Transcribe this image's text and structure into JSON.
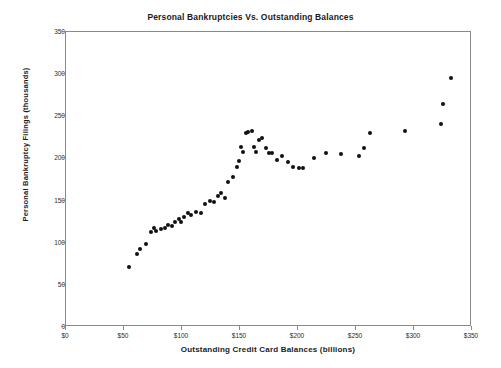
{
  "chart_data": {
    "type": "scatter",
    "title": "Personal Bankruptcies Vs. Outstanding Balances",
    "xlabel": "Outstanding Credit Card Balances (billions)",
    "ylabel": "Personal Bankruptcy Filings (thousands)",
    "xlim": [
      0,
      350
    ],
    "ylim": [
      0,
      350
    ],
    "xticks": [
      0,
      50,
      100,
      150,
      200,
      250,
      300,
      350
    ],
    "xtick_labels": [
      "$0",
      "$50",
      "$100",
      "$150",
      "$200",
      "$250",
      "$300",
      "$350"
    ],
    "yticks": [
      0,
      50,
      100,
      150,
      200,
      250,
      300,
      350
    ],
    "ytick_labels": [
      "0",
      "50",
      "100",
      "150",
      "200",
      "250",
      "300",
      "350"
    ],
    "grid": false,
    "legend": null,
    "marker_color": "#111111",
    "frame_color": "#8a8a8a",
    "series": [
      {
        "name": "Bankruptcy filings vs credit card balances",
        "points": [
          [
            54,
            71
          ],
          [
            61,
            87
          ],
          [
            64,
            93
          ],
          [
            69,
            99
          ],
          [
            73,
            113
          ],
          [
            76,
            118
          ],
          [
            78,
            114
          ],
          [
            82,
            116
          ],
          [
            85,
            118
          ],
          [
            88,
            121
          ],
          [
            91,
            120
          ],
          [
            94,
            124
          ],
          [
            97,
            128
          ],
          [
            99,
            125
          ],
          [
            102,
            131
          ],
          [
            105,
            135
          ],
          [
            108,
            133
          ],
          [
            112,
            136
          ],
          [
            116,
            135
          ],
          [
            120,
            146
          ],
          [
            124,
            150
          ],
          [
            128,
            148
          ],
          [
            131,
            155
          ],
          [
            134,
            159
          ],
          [
            137,
            153
          ],
          [
            140,
            172
          ],
          [
            144,
            178
          ],
          [
            147,
            190
          ],
          [
            149,
            197
          ],
          [
            151,
            213
          ],
          [
            153,
            208
          ],
          [
            155,
            230
          ],
          [
            157,
            231
          ],
          [
            160,
            233
          ],
          [
            162,
            214
          ],
          [
            164,
            208
          ],
          [
            166,
            222
          ],
          [
            169,
            224
          ],
          [
            172,
            212
          ],
          [
            175,
            206
          ],
          [
            178,
            207
          ],
          [
            182,
            198
          ],
          [
            186,
            203
          ],
          [
            191,
            196
          ],
          [
            196,
            190
          ],
          [
            201,
            189
          ],
          [
            204,
            189
          ],
          [
            214,
            200
          ],
          [
            224,
            206
          ],
          [
            237,
            205
          ],
          [
            253,
            203
          ],
          [
            257,
            212
          ],
          [
            262,
            230
          ],
          [
            292,
            232
          ],
          [
            323,
            241
          ],
          [
            325,
            265
          ],
          [
            332,
            296
          ]
        ]
      }
    ]
  }
}
